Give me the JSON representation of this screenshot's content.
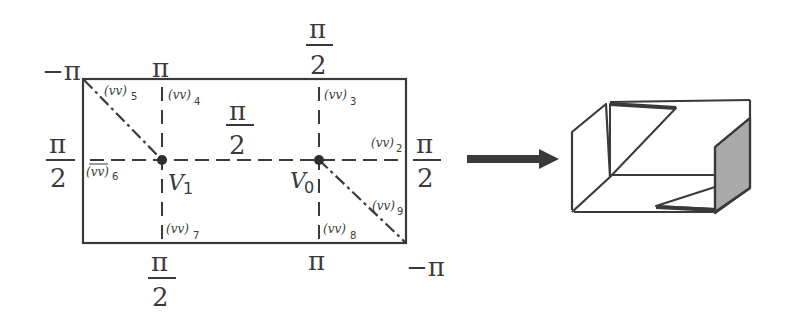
{
  "diagram": {
    "left_panel": {
      "type": "crease-pattern-rectangle",
      "corner_labels": {
        "top_left": "−π",
        "bottom_right": "−π"
      },
      "top_labels": {
        "v1_column": "π",
        "v0_column": {
          "num": "π",
          "den": "2"
        }
      },
      "bottom_labels": {
        "v1_column": {
          "num": "π",
          "den": "2"
        },
        "v0_column": "π"
      },
      "side_labels": {
        "left": {
          "num": "π",
          "den": "2"
        },
        "right": {
          "num": "π",
          "den": "2"
        }
      },
      "center_label": {
        "num": "π",
        "den": "2"
      },
      "vertices": [
        {
          "name": "V",
          "sub": "1"
        },
        {
          "name": "V",
          "sub": "0"
        }
      ],
      "edge_labels": [
        {
          "text": "(vv)",
          "sub": "2"
        },
        {
          "text": "(vv)",
          "sub": "3"
        },
        {
          "text": "(vv)",
          "sub": "4"
        },
        {
          "text": "(vv)",
          "sub": "5"
        },
        {
          "text": "(vv)",
          "sub": "6",
          "overline": true
        },
        {
          "text": "(vv)",
          "sub": "7"
        },
        {
          "text": "(vv)",
          "sub": "8"
        },
        {
          "text": "(vv)",
          "sub": "9"
        }
      ]
    },
    "arrow": {
      "direction": "right",
      "color": "#3a3a3a"
    },
    "right_panel": {
      "type": "folded-box-3d",
      "shaded_face_color": "#a9a9a9",
      "line_color": "#3a3a3a"
    }
  }
}
